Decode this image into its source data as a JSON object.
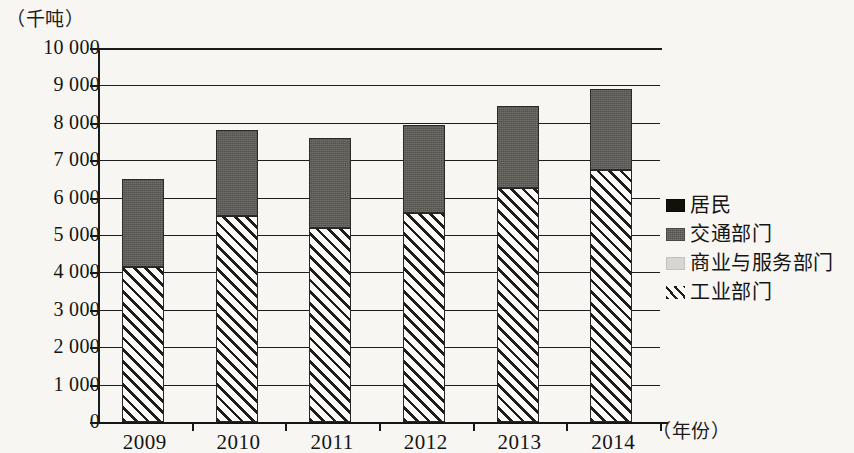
{
  "chart_data": {
    "type": "bar",
    "stacked": true,
    "title": "",
    "subtitle": "",
    "xlabel": "（年份）",
    "ylabel": "（千吨）",
    "categories": [
      "2009",
      "2010",
      "2011",
      "2012",
      "2013",
      "2014"
    ],
    "ylim": [
      0,
      10000
    ],
    "ytick_step": 1000,
    "ytick_labels": [
      "10 000",
      "9 000",
      "8 000",
      "7 000",
      "6 000",
      "5 000",
      "4 000",
      "3 000",
      "2 000",
      "1 000",
      "0"
    ],
    "ytick_values": [
      10000,
      9000,
      8000,
      7000,
      6000,
      5000,
      4000,
      3000,
      2000,
      1000,
      0
    ],
    "grid": true,
    "legend_position": "right",
    "series": [
      {
        "name": "工业部门",
        "key": "industry",
        "pattern": "diagonal-hatch",
        "color": "#1d1d1d",
        "values": [
          4150,
          5500,
          5200,
          5600,
          6250,
          6750
        ]
      },
      {
        "name": "商业与服务部门",
        "key": "commercial",
        "pattern": "solid",
        "color": "#d3d1cc",
        "values": [
          0,
          0,
          0,
          0,
          0,
          0
        ]
      },
      {
        "name": "交通部门",
        "key": "transport",
        "pattern": "solid",
        "color": "#5d5b56",
        "values": [
          2350,
          2300,
          2400,
          2350,
          2200,
          2150
        ]
      },
      {
        "name": "居民",
        "key": "residential",
        "pattern": "solid",
        "color": "#17160f",
        "values": [
          0,
          0,
          0,
          0,
          0,
          0
        ]
      }
    ],
    "totals": [
      6500,
      7800,
      7600,
      7950,
      8450,
      8900
    ]
  },
  "legend": {
    "items": [
      {
        "label": "居民",
        "swatch": "sw-residential"
      },
      {
        "label": "交通部门",
        "swatch": "sw-transport"
      },
      {
        "label": "商业与服务部门",
        "swatch": "sw-commercial"
      },
      {
        "label": "工业部门",
        "swatch": "sw-industry"
      }
    ]
  }
}
